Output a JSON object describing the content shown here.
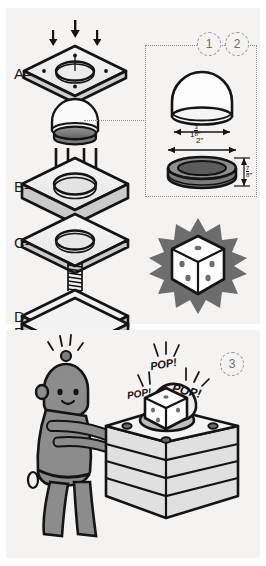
{
  "figure": {
    "background_color": "#f4f3f1",
    "ink_color": "#141414"
  },
  "panels": {
    "top": {
      "name": "exploded-parts-panel"
    },
    "bottom": {
      "name": "operation-panel"
    }
  },
  "part_labels": [
    {
      "id": "A",
      "label": "A–",
      "description": "top plate with center hole and four corner screw holes"
    },
    {
      "id": "B",
      "label": "B–",
      "description": "thick block with center bore"
    },
    {
      "id": "C",
      "label": "C–",
      "description": "thin plate with center hole"
    },
    {
      "id": "D",
      "label": "D–",
      "description": "plate with center dot"
    },
    {
      "id": "E",
      "label": "E–",
      "description": "bottom base plate"
    }
  ],
  "step_numbers": [
    {
      "value": "1",
      "name": "step-number-1"
    },
    {
      "value": "2",
      "name": "step-number-2"
    },
    {
      "value": "3",
      "name": "step-number-3"
    }
  ],
  "callout": {
    "name": "dimension-callout-box",
    "items": [
      {
        "name": "dome-width-dimension",
        "subject": "dome cap",
        "whole": "1",
        "numerator": "3",
        "denominator": "8",
        "unit": "”",
        "orientation": "horizontal"
      },
      {
        "name": "ring-width-dimension",
        "subject": "ring base",
        "whole": "2",
        "numerator": "",
        "denominator": "",
        "unit": "”",
        "orientation": "horizontal"
      },
      {
        "name": "ring-height-dimension",
        "subject": "ring base",
        "whole": "",
        "numerator": "7",
        "denominator": "8",
        "unit": "”",
        "orientation": "vertical"
      }
    ]
  },
  "die_graphic": {
    "name": "die-burst-graphic",
    "face_value_top": "1",
    "face_value_left": "3",
    "face_value_right": "2",
    "burst_color": "#6d6d6d",
    "die_color": "#ffffff"
  },
  "scene": {
    "name": "robot-pressing-device-scene",
    "character": {
      "name": "robot-character",
      "body_color": "#8c8c8c",
      "has_antenna": true,
      "expression": "smiling"
    },
    "device": {
      "name": "assembled-device",
      "layers": 4,
      "screw_count": 4,
      "dome_color": "#e9e9e9"
    },
    "sound_effects": [
      {
        "text": "POP!",
        "name": "sound-effect-pop-1"
      },
      {
        "text": "POP!",
        "name": "sound-effect-pop-2"
      },
      {
        "text": "POP!",
        "name": "sound-effect-pop-3"
      }
    ]
  }
}
